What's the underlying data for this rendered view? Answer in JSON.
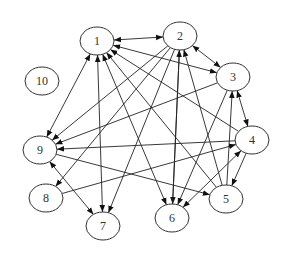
{
  "diagram": {
    "type": "directed-graph",
    "node_rx": 17,
    "node_ry": 14,
    "colors": {
      "stroke": "#333333",
      "edge": "#222222",
      "background": "#ffffff"
    },
    "nodes": [
      {
        "id": "1",
        "label": "1",
        "x": 97,
        "y": 41
      },
      {
        "id": "2",
        "label": "2",
        "x": 180,
        "y": 36
      },
      {
        "id": "3",
        "label": "3",
        "x": 233,
        "y": 77
      },
      {
        "id": "4",
        "label": "4",
        "x": 252,
        "y": 140
      },
      {
        "id": "5",
        "label": "5",
        "x": 226,
        "y": 199
      },
      {
        "id": "6",
        "label": "6",
        "x": 172,
        "y": 218
      },
      {
        "id": "7",
        "label": "7",
        "x": 103,
        "y": 226
      },
      {
        "id": "8",
        "label": "8",
        "x": 46,
        "y": 198
      },
      {
        "id": "9",
        "label": "9",
        "x": 40,
        "y": 150
      },
      {
        "id": "10",
        "label": "10",
        "x": 42,
        "y": 81
      }
    ],
    "edges": [
      {
        "from": "1",
        "to": "2",
        "bidirectional": true
      },
      {
        "from": "1",
        "to": "3",
        "bidirectional": true
      },
      {
        "from": "1",
        "to": "9",
        "bidirectional": true
      },
      {
        "from": "1",
        "to": "7",
        "bidirectional": true
      },
      {
        "from": "6",
        "to": "1",
        "bidirectional": true
      },
      {
        "from": "5",
        "to": "1",
        "bidirectional": false
      },
      {
        "from": "4",
        "to": "1",
        "bidirectional": false
      },
      {
        "from": "2",
        "to": "3",
        "bidirectional": true
      },
      {
        "from": "2",
        "to": "9",
        "bidirectional": false
      },
      {
        "from": "2",
        "to": "8",
        "bidirectional": false
      },
      {
        "from": "2",
        "to": "7",
        "bidirectional": false
      },
      {
        "from": "2",
        "to": "6",
        "bidirectional": false
      },
      {
        "from": "6",
        "to": "2",
        "bidirectional": false
      },
      {
        "from": "5",
        "to": "2",
        "bidirectional": false
      },
      {
        "from": "3",
        "to": "9",
        "bidirectional": false
      },
      {
        "from": "3",
        "to": "6",
        "bidirectional": false
      },
      {
        "from": "3",
        "to": "4",
        "bidirectional": true
      },
      {
        "from": "5",
        "to": "3",
        "bidirectional": false
      },
      {
        "from": "4",
        "to": "5",
        "bidirectional": false
      },
      {
        "from": "4",
        "to": "6",
        "bidirectional": true
      },
      {
        "from": "8",
        "to": "4",
        "bidirectional": false
      },
      {
        "from": "9",
        "to": "5",
        "bidirectional": false
      },
      {
        "from": "4",
        "to": "9",
        "bidirectional": false
      },
      {
        "from": "9",
        "to": "7",
        "bidirectional": true
      }
    ]
  }
}
